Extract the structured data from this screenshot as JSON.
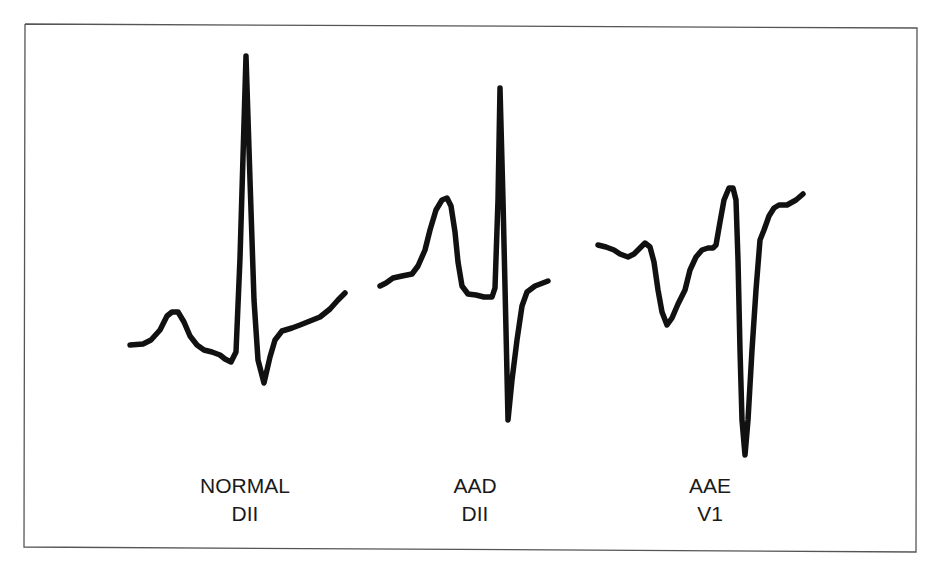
{
  "figure": {
    "border": {
      "points": "25,24 917,28 916,552 24,547 25,24",
      "color": "#555555"
    },
    "trace_color": "#111111",
    "traces": [
      {
        "id": "normal-dii",
        "points": "130,345 143,344 151,340 160,330 167,316 172,312 178,312 184,322 190,336 197,345 204,350 212,352 220,355 225,359 231,362 236,352 240,258 246,56 250,180 254,300 258,360 264,383 270,357 275,340 282,331 292,328 300,325 310,321 320,317 330,309 338,300 345,293",
        "label": {
          "line1": "NORMAL",
          "line2": "DII"
        }
      },
      {
        "id": "aad-dii",
        "points": "380,286 386,283 393,278 402,276 412,274 418,266 425,250 430,230 436,210 442,200 447,198 451,206 455,232 458,262 462,286 468,294 476,295 484,297 492,297 495,288 498,200 500,88 503,200 506,330 508,420 512,380 517,340 522,306 527,292 535,286 548,281",
        "label": {
          "line1": "AAD",
          "line2": "DII"
        }
      },
      {
        "id": "aae-v1",
        "points": "598,245 606,247 614,250 620,254 628,257 634,254 640,248 645,243 650,247 654,262 658,290 662,312 667,325 672,318 678,304 685,290 690,270 696,257 702,250 708,248 713,248 716,245 720,222 724,200 729,188 733,188 736,200 738,260 740,350 742,420 745,455 748,420 752,350 756,290 760,240 764,230 769,216 774,208 779,205 787,205 796,200 803,194",
        "label": {
          "line1": "AAE",
          "line2": "V1"
        }
      }
    ]
  }
}
